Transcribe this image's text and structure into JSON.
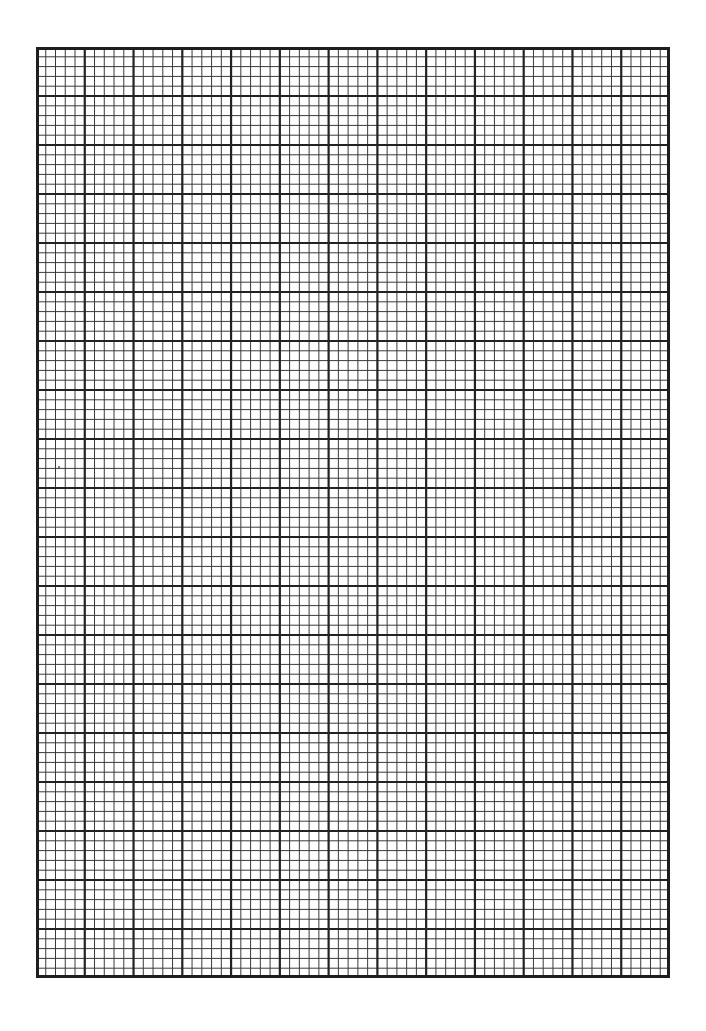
{
  "document": {
    "type": "graph-paper",
    "major_columns": 13,
    "major_rows": 19,
    "minor_divisions_per_major": 5,
    "colors": {
      "paper": "#ffffff",
      "minor_line": "#3a3a3a",
      "major_line": "#222222",
      "border": "#1e1e1e"
    }
  }
}
